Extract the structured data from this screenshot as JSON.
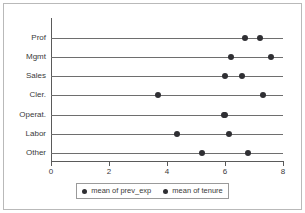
{
  "chart_data": {
    "type": "scatter",
    "title": "",
    "subtitle": "",
    "xlabel": "",
    "ylabel": "",
    "categories": [
      "Prof",
      "Mgmt",
      "Sales",
      "Cler.",
      "Operat.",
      "Labor",
      "Other"
    ],
    "series": [
      {
        "name": "mean of prev_exp",
        "color": "#2f2f33",
        "marker": "circle",
        "values": [
          6.7,
          6.2,
          6.0,
          3.7,
          5.95,
          4.35,
          5.2
        ]
      },
      {
        "name": "mean of tenure",
        "color": "#2f2f33",
        "marker": "circle",
        "values": [
          7.2,
          7.6,
          6.6,
          7.3,
          6.0,
          6.15,
          6.8
        ]
      }
    ],
    "xlim": [
      0,
      8
    ],
    "xticks": [
      0,
      2,
      4,
      6,
      8
    ],
    "xtick_labels": [
      "0",
      "2",
      "4",
      "6",
      "8"
    ],
    "grid": false,
    "orientation": "horizontal",
    "legend": {
      "position": "bottom",
      "entries": [
        {
          "label": "mean of prev_exp",
          "color": "#2f2f33"
        },
        {
          "label": "mean of tenure",
          "color": "#2f2f33"
        }
      ]
    },
    "style": {
      "background": "#ffffff",
      "axis_color": "#5a5a5a",
      "rule_color": "#6e6e6e",
      "text_color": "#3a3a3a",
      "frame_color": "#b9b9b9"
    }
  }
}
